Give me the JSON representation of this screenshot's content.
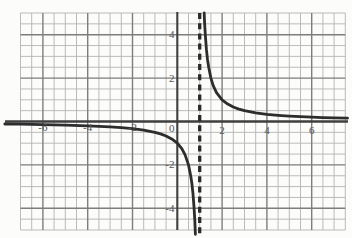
{
  "chart_data": {
    "type": "line",
    "title": "",
    "function": "y = 1/(x-1)",
    "grid": true,
    "legend": false,
    "asymptotes": {
      "vertical_x": 1,
      "vertical_style": "dashed",
      "horizontal_y": 0
    },
    "axes": {
      "x": {
        "min": -7,
        "max": 7.5,
        "minor_step": 0.5,
        "major_step": 2,
        "tick_values": [
          -6,
          -4,
          -2,
          2,
          4,
          6
        ],
        "tick_labels": [
          "-6",
          "-4",
          "-2",
          "2",
          "4",
          "6"
        ]
      },
      "y": {
        "min": -5,
        "max": 5,
        "minor_step": 0.5,
        "major_step": 2,
        "tick_values": [
          4,
          2,
          -2,
          -4
        ],
        "tick_labels": [
          "4",
          "2",
          "-2",
          "-4"
        ]
      },
      "origin_label": "0"
    },
    "series": [
      {
        "name": "left-branch",
        "points": [
          [
            -7.7,
            -0.115
          ],
          [
            -7,
            -0.125
          ],
          [
            -6,
            -0.143
          ],
          [
            -5,
            -0.167
          ],
          [
            -4,
            -0.2
          ],
          [
            -3,
            -0.25
          ],
          [
            -2.5,
            -0.286
          ],
          [
            -2,
            -0.333
          ],
          [
            -1.5,
            -0.4
          ],
          [
            -1,
            -0.5
          ],
          [
            -0.75,
            -0.571
          ],
          [
            -0.5,
            -0.667
          ],
          [
            -0.25,
            -0.8
          ],
          [
            0,
            -1
          ],
          [
            0.2,
            -1.25
          ],
          [
            0.35,
            -1.538
          ],
          [
            0.5,
            -2
          ],
          [
            0.6,
            -2.5
          ],
          [
            0.65,
            -2.857
          ],
          [
            0.7,
            -3.333
          ],
          [
            0.75,
            -4
          ],
          [
            0.78,
            -4.545
          ],
          [
            0.8,
            -5
          ],
          [
            0.81,
            -5.2
          ]
        ]
      },
      {
        "name": "right-branch",
        "points": [
          [
            1.2,
            5
          ],
          [
            1.21,
            4.762
          ],
          [
            1.22,
            4.545
          ],
          [
            1.25,
            4
          ],
          [
            1.3,
            3.333
          ],
          [
            1.35,
            2.857
          ],
          [
            1.4,
            2.5
          ],
          [
            1.5,
            2
          ],
          [
            1.6,
            1.667
          ],
          [
            1.75,
            1.333
          ],
          [
            2,
            1
          ],
          [
            2.25,
            0.8
          ],
          [
            2.5,
            0.667
          ],
          [
            2.75,
            0.571
          ],
          [
            3,
            0.5
          ],
          [
            3.5,
            0.4
          ],
          [
            4,
            0.333
          ],
          [
            4.5,
            0.286
          ],
          [
            5,
            0.25
          ],
          [
            5.5,
            0.222
          ],
          [
            6,
            0.2
          ],
          [
            6.5,
            0.182
          ],
          [
            7,
            0.167
          ],
          [
            7.6,
            0.152
          ]
        ]
      }
    ],
    "colors": {
      "background": "#fcfcfb",
      "minor_grid": "#b3b3b3",
      "major_grid": "#7d7d7d",
      "axis": "#3f3f3f",
      "curve": "#2d2d2d",
      "asymptote": "#2a2a2a",
      "label": "#555555"
    }
  }
}
